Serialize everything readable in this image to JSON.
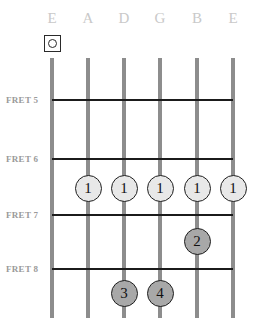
{
  "diagram": {
    "type": "guitar-chord-diagram",
    "width": 253,
    "height": 318,
    "background_color": "#ffffff"
  },
  "strings": [
    {
      "label": "E",
      "x": 52,
      "name": "low-e"
    },
    {
      "label": "A",
      "x": 88,
      "name": "a"
    },
    {
      "label": "D",
      "x": 124,
      "name": "d"
    },
    {
      "label": "G",
      "x": 160,
      "name": "g"
    },
    {
      "label": "B",
      "x": 197,
      "name": "b"
    },
    {
      "label": "E",
      "x": 233,
      "name": "high-e"
    }
  ],
  "string_style": {
    "color": "#8d8d8d",
    "top": 58,
    "bottom": 318,
    "width": 4
  },
  "frets": [
    {
      "label": "FRET 5",
      "y": 99,
      "label_y": 95
    },
    {
      "label": "FRET 6",
      "y": 158,
      "label_y": 154
    },
    {
      "label": "FRET 7",
      "y": 214,
      "label_y": 210
    },
    {
      "label": "FRET 8",
      "y": 268,
      "label_y": 264
    }
  ],
  "fret_style": {
    "color": "#1b1b1b",
    "left": 52,
    "width": 181
  },
  "open_markers": [
    {
      "symbol": "open-string",
      "x": 52,
      "y": 35
    }
  ],
  "fingers": [
    {
      "label": "1",
      "x": 88,
      "y": 188,
      "color": "#e8e8e8"
    },
    {
      "label": "1",
      "x": 124,
      "y": 188,
      "color": "#e8e8e8"
    },
    {
      "label": "1",
      "x": 160,
      "y": 188,
      "color": "#e8e8e8"
    },
    {
      "label": "1",
      "x": 197,
      "y": 188,
      "color": "#e8e8e8"
    },
    {
      "label": "1",
      "x": 233,
      "y": 188,
      "color": "#e8e8e8"
    },
    {
      "label": "2",
      "x": 197,
      "y": 241,
      "color": "#a8a8a8"
    },
    {
      "label": "3",
      "x": 124,
      "y": 293,
      "color": "#a8a8a8"
    },
    {
      "label": "4",
      "x": 160,
      "y": 293,
      "color": "#a8a8a8"
    }
  ],
  "colors": {
    "string_label": "#c9c9c9",
    "fret_label": "#9a9a9a",
    "fret_line": "#1b1b1b",
    "string_line": "#8d8d8d",
    "finger_light": "#e8e8e8",
    "finger_dark": "#a8a8a8",
    "outline": "#1f1f1f"
  }
}
